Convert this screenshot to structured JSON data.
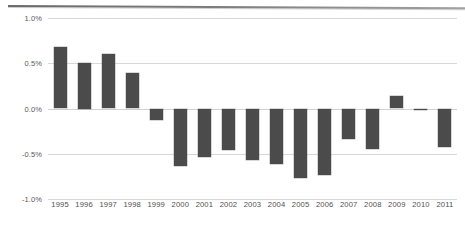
{
  "chart_data": {
    "type": "bar",
    "title": "",
    "subtitle": "",
    "xlabel": "",
    "ylabel": "",
    "categories": [
      "1995",
      "1996",
      "1997",
      "1998",
      "1999",
      "2000",
      "2001",
      "2002",
      "2003",
      "2004",
      "2005",
      "2006",
      "2007",
      "2008",
      "2009",
      "2010",
      "2011"
    ],
    "values": [
      0.68,
      0.5,
      0.6,
      0.39,
      -0.13,
      -0.63,
      -0.54,
      -0.46,
      -0.57,
      -0.61,
      -0.77,
      -0.73,
      -0.34,
      -0.45,
      0.14,
      -0.02,
      -0.42
    ],
    "series": [
      {
        "name": "",
        "values": [
          0.68,
          0.5,
          0.6,
          0.39,
          -0.13,
          -0.63,
          -0.54,
          -0.46,
          -0.57,
          -0.61,
          -0.77,
          -0.73,
          -0.34,
          -0.45,
          0.14,
          -0.02,
          -0.42
        ]
      }
    ],
    "ylim": [
      -1.0,
      1.0
    ],
    "yticks": [
      1.0,
      0.5,
      0.0,
      -0.5,
      -1.0
    ],
    "ytick_labels": [
      "1.0%",
      "0.5%",
      "0.0%",
      "-0.5%",
      "-1.0%"
    ],
    "value_unit": "%",
    "grid": true,
    "legend": false,
    "legend_position": "none",
    "bar_color": "#4b4b4b",
    "gridline_color": "#d8d8d8",
    "axis_text_color": "#5a5a5a",
    "background_color": "#ffffff"
  }
}
